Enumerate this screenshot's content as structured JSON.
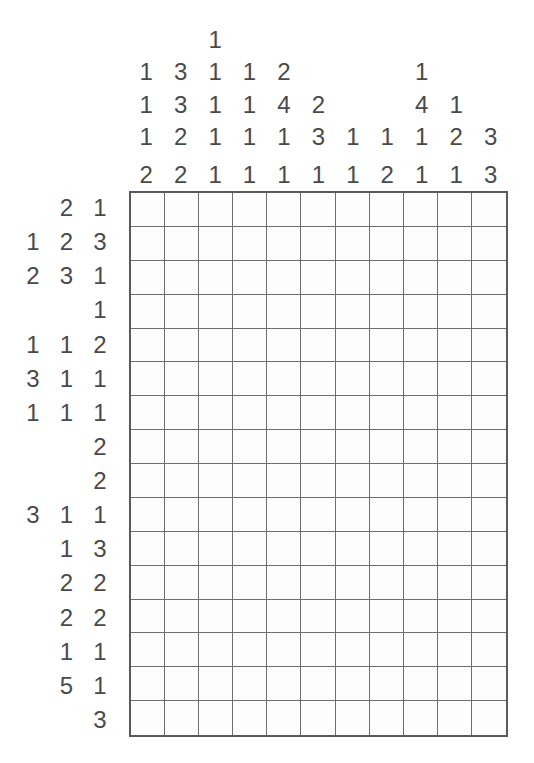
{
  "puzzle": {
    "type": "nonogram",
    "title": "Nonogram",
    "grid": {
      "columns": 11,
      "rows": 16,
      "cell_size_px": 34,
      "origin_px": {
        "x": 129,
        "y": 191
      },
      "background_color": "#fdfdfd",
      "border_color": "#5a5a5a",
      "gridline_color": "#6e6e6e",
      "filled_color": "#2b2b2b",
      "state": "empty"
    },
    "clue_color": "#4a4a4a",
    "column_clue_depth": 4,
    "row_clue_width": 3,
    "column_clues": [
      [
        1,
        1,
        1,
        2
      ],
      [
        3,
        3,
        2,
        2
      ],
      [
        1,
        1,
        1,
        1,
        1
      ],
      [
        1,
        1,
        1,
        1
      ],
      [
        2,
        4,
        1,
        1
      ],
      [
        2,
        3,
        1
      ],
      [
        1,
        1
      ],
      [
        1,
        2
      ],
      [
        1,
        4,
        1,
        1
      ],
      [
        1,
        2,
        1
      ],
      [
        3,
        3
      ]
    ],
    "column_clue_grid": [
      [
        "",
        "",
        "1",
        "",
        "",
        "",
        "",
        "",
        "",
        "",
        ""
      ],
      [
        "1",
        "3",
        "1",
        "1",
        "2",
        "",
        "",
        "",
        "1",
        "",
        ""
      ],
      [
        "1",
        "3",
        "1",
        "1",
        "4",
        "2",
        "",
        "",
        "4",
        "1",
        ""
      ],
      [
        "1",
        "2",
        "1",
        "1",
        "1",
        "3",
        "1",
        "1",
        "1",
        "2",
        "3"
      ],
      [
        "2",
        "2",
        "1",
        "1",
        "1",
        "1",
        "1",
        "2",
        "1",
        "1",
        "3"
      ]
    ],
    "row_clues": [
      [
        2,
        1
      ],
      [
        1,
        2,
        3
      ],
      [
        2,
        3,
        1
      ],
      [
        1
      ],
      [
        1,
        1,
        2
      ],
      [
        3,
        1,
        1
      ],
      [
        1,
        1,
        1
      ],
      [
        2
      ],
      [
        2
      ],
      [
        3,
        1,
        1
      ],
      [
        1,
        3
      ],
      [
        2,
        2
      ],
      [
        2,
        2
      ],
      [
        1,
        1
      ],
      [
        5,
        1
      ],
      [
        3
      ]
    ],
    "row_clue_grid": [
      [
        "",
        "2",
        "1"
      ],
      [
        "1",
        "2",
        "3"
      ],
      [
        "2",
        "3",
        "1"
      ],
      [
        "",
        "",
        "1"
      ],
      [
        "1",
        "1",
        "2"
      ],
      [
        "3",
        "1",
        "1"
      ],
      [
        "1",
        "1",
        "1"
      ],
      [
        "",
        "",
        "2"
      ],
      [
        "",
        "",
        "2"
      ],
      [
        "3",
        "1",
        "1"
      ],
      [
        "",
        "1",
        "3"
      ],
      [
        "",
        "2",
        "2"
      ],
      [
        "",
        "2",
        "2"
      ],
      [
        "",
        "1",
        "1"
      ],
      [
        "",
        "5",
        "1"
      ],
      [
        "",
        "",
        "3"
      ]
    ]
  }
}
